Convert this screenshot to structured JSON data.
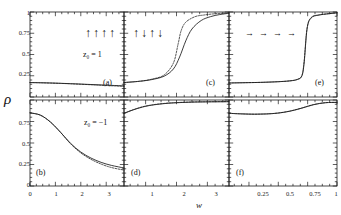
{
  "figure": {
    "ylabel": "ρ",
    "xlabel": "w",
    "background": "#ffffff",
    "line_color": "#1a1a1a"
  },
  "axes": {
    "y_ticks_top": [
      "1",
      "0.75",
      "0.5",
      "0.25"
    ],
    "y_ticks_bottom": [
      "0.75",
      "0.5",
      "0.25",
      "0"
    ],
    "y_range": [
      0,
      1
    ],
    "x_ticks_col1": [
      "0",
      "1",
      "2",
      "3"
    ],
    "x_ticks_col2": [
      "1",
      "2",
      "3"
    ],
    "x_ticks_col3": [
      "0.25",
      "0.5",
      "0.75",
      "1"
    ],
    "x_range_col1": [
      0,
      3.7
    ],
    "x_range_col2": [
      0.3,
      3.7
    ],
    "x_range_col3": [
      0.08,
      1.0
    ],
    "grid": false
  },
  "annotations": {
    "z0_up": "z₀ = 1",
    "z0_down": "z₀ = −1",
    "spins_a": [
      "↑",
      "↑",
      "↑",
      "↑"
    ],
    "spins_c": [
      "↑",
      "↓",
      "↑",
      "↓"
    ],
    "arrows_e": [
      "→",
      "→",
      "→",
      "→"
    ]
  },
  "panels": [
    {
      "tag": "(a)",
      "row": "top",
      "col": 1
    },
    {
      "tag": "(b)",
      "row": "bottom",
      "col": 1
    },
    {
      "tag": "(c)",
      "row": "top",
      "col": 2
    },
    {
      "tag": "(d)",
      "row": "bottom",
      "col": 2
    },
    {
      "tag": "(e)",
      "row": "top",
      "col": 3
    },
    {
      "tag": "(f)",
      "row": "bottom",
      "col": 3
    }
  ],
  "chart_data": {
    "type": "line",
    "title": "",
    "xlabel": "w",
    "ylabel": "ρ",
    "ylim": [
      0,
      1
    ],
    "legend": "none",
    "grid": false,
    "subplots": [
      {
        "tag": "(a)",
        "initial_state": "z₀ = 1, all spins up",
        "xlim": [
          0,
          3.7
        ],
        "series": [
          {
            "name": "solid",
            "style": "solid",
            "x": [
              0,
              0.4,
              0.8,
              1.2,
              1.6,
              2.0,
              2.4,
              2.8,
              3.2,
              3.7
            ],
            "y": [
              0.17,
              0.168,
              0.165,
              0.161,
              0.157,
              0.152,
              0.147,
              0.142,
              0.137,
              0.131
            ]
          },
          {
            "name": "dotted",
            "style": "dotted",
            "x": [
              0,
              0.4,
              0.8,
              1.2,
              1.6,
              2.0,
              2.4,
              2.8,
              3.2,
              3.7
            ],
            "y": [
              0.17,
              0.167,
              0.164,
              0.16,
              0.155,
              0.15,
              0.144,
              0.138,
              0.132,
              0.125
            ]
          }
        ]
      },
      {
        "tag": "(b)",
        "initial_state": "z₀ = −1, all spins up",
        "xlim": [
          0,
          3.7
        ],
        "series": [
          {
            "name": "solid",
            "style": "solid",
            "x": [
              0,
              0.4,
              0.8,
              1.2,
              1.6,
              2.0,
              2.4,
              2.8,
              3.2,
              3.7
            ],
            "y": [
              0.85,
              0.825,
              0.745,
              0.625,
              0.495,
              0.395,
              0.325,
              0.275,
              0.24,
              0.21
            ]
          },
          {
            "name": "dotted",
            "style": "dotted",
            "x": [
              0,
              0.4,
              0.8,
              1.2,
              1.6,
              2.0,
              2.4,
              2.8,
              3.2,
              3.7
            ],
            "y": [
              0.85,
              0.825,
              0.745,
              0.625,
              0.49,
              0.385,
              0.31,
              0.255,
              0.215,
              0.185
            ]
          }
        ]
      },
      {
        "tag": "(c)",
        "initial_state": "z₀ = 1, alternating spins",
        "xlim": [
          0.3,
          3.7
        ],
        "series": [
          {
            "name": "solid",
            "style": "solid",
            "x": [
              0.3,
              0.8,
              1.2,
              1.6,
              1.9,
              2.1,
              2.3,
              2.5,
              2.8,
              3.1,
              3.4,
              3.7
            ],
            "y": [
              0.17,
              0.185,
              0.205,
              0.245,
              0.33,
              0.47,
              0.66,
              0.8,
              0.9,
              0.945,
              0.97,
              0.985
            ]
          },
          {
            "name": "dotted",
            "style": "dotted",
            "x": [
              0.3,
              0.8,
              1.2,
              1.6,
              1.9,
              2.05,
              2.15,
              2.3,
              2.6,
              2.9,
              3.2,
              3.7
            ],
            "y": [
              0.17,
              0.185,
              0.21,
              0.26,
              0.4,
              0.62,
              0.78,
              0.88,
              0.945,
              0.965,
              0.978,
              0.99
            ]
          }
        ]
      },
      {
        "tag": "(d)",
        "initial_state": "z₀ = −1, alternating spins",
        "xlim": [
          0.3,
          3.7
        ],
        "series": [
          {
            "name": "solid",
            "style": "solid",
            "x": [
              0.3,
              0.6,
              0.9,
              1.2,
              1.6,
              2.0,
              2.5,
              3.0,
              3.7
            ],
            "y": [
              0.845,
              0.885,
              0.918,
              0.94,
              0.958,
              0.968,
              0.975,
              0.978,
              0.98
            ]
          },
          {
            "name": "dotted",
            "style": "dotted",
            "x": [
              0.3,
              0.6,
              0.9,
              1.2,
              1.6,
              2.0,
              2.5,
              3.0,
              3.7
            ],
            "y": [
              0.845,
              0.888,
              0.921,
              0.943,
              0.96,
              0.97,
              0.977,
              0.98,
              0.982
            ]
          }
        ]
      },
      {
        "tag": "(e)",
        "initial_state": "z₀ = 1, in-plane spins",
        "xlim": [
          0.08,
          1.0
        ],
        "series": [
          {
            "name": "solid",
            "style": "solid",
            "x": [
              0.08,
              0.2,
              0.35,
              0.5,
              0.6,
              0.66,
              0.7,
              0.72,
              0.745,
              0.78,
              0.85,
              1.0
            ],
            "y": [
              0.165,
              0.168,
              0.172,
              0.18,
              0.19,
              0.205,
              0.245,
              0.4,
              0.8,
              0.93,
              0.965,
              0.99
            ]
          },
          {
            "name": "dotted",
            "style": "dotted",
            "x": [
              0.08,
              0.2,
              0.35,
              0.5,
              0.6,
              0.66,
              0.7,
              0.72,
              0.745,
              0.78,
              0.85,
              1.0
            ],
            "y": [
              0.165,
              0.168,
              0.172,
              0.18,
              0.19,
              0.207,
              0.25,
              0.42,
              0.81,
              0.935,
              0.967,
              0.99
            ]
          }
        ]
      },
      {
        "tag": "(f)",
        "initial_state": "z₀ = −1, in-plane spins",
        "xlim": [
          0.08,
          1.0
        ],
        "series": [
          {
            "name": "solid",
            "style": "solid",
            "x": [
              0.08,
              0.2,
              0.3,
              0.4,
              0.5,
              0.6,
              0.7,
              0.8,
              0.9,
              1.0
            ],
            "y": [
              0.845,
              0.838,
              0.835,
              0.838,
              0.848,
              0.87,
              0.905,
              0.945,
              0.968,
              0.972
            ]
          },
          {
            "name": "dotted",
            "style": "dotted",
            "x": [
              0.08,
              0.2,
              0.3,
              0.4,
              0.5,
              0.6,
              0.7,
              0.8,
              0.9,
              1.0
            ],
            "y": [
              0.845,
              0.838,
              0.835,
              0.838,
              0.849,
              0.872,
              0.907,
              0.947,
              0.969,
              0.973
            ]
          }
        ]
      }
    ]
  }
}
